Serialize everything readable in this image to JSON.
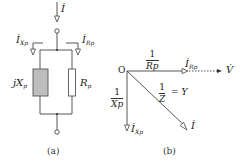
{
  "figure_a": {
    "caption": "(a)",
    "current_total": "İ",
    "current_x_branch": "İ",
    "current_x_sub": "Xp",
    "current_r_branch": "İ",
    "current_r_sub": "Rp",
    "reactance_label": "jX",
    "reactance_sub": "p",
    "resistance_label": "R",
    "resistance_sub": "p"
  },
  "figure_b": {
    "caption": "(b)",
    "origin": "O",
    "voltage": "V̇",
    "frac_r_num": "1",
    "frac_r_den": "Rp",
    "frac_x_num": "1",
    "frac_x_den": "Xp",
    "frac_z_num": "1",
    "frac_z_den": "Z",
    "equals_y": "= Y",
    "current_r": "İ",
    "current_r_sub": "Rp",
    "current_x": "İ",
    "current_x_sub": "Xp",
    "current_total": "İ"
  },
  "colors": {
    "line": "#444444",
    "reactor_fill": "#bdbdbd"
  }
}
